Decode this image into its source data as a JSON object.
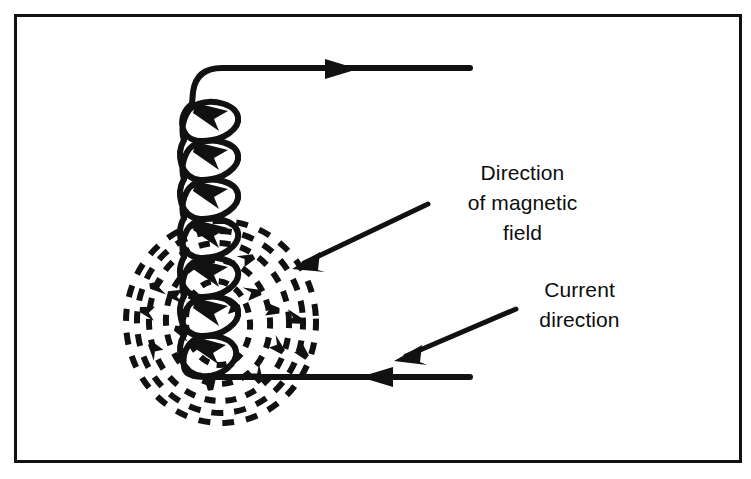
{
  "figure": {
    "background_color": "#ffffff",
    "ink_color": "#111111",
    "border": {
      "name": "figure-border",
      "x": 14,
      "y": 14,
      "width": 727,
      "height": 448,
      "stroke_width": 3
    }
  },
  "labels": {
    "magnetic_field": {
      "line1": "Direction",
      "line2": "of magnetic",
      "line3": "field",
      "full_text": "Direction of magnetic field"
    },
    "current": {
      "line1": "Current",
      "line2": "direction",
      "full_text": "Current direction"
    }
  },
  "annotations": {
    "magnetic_field_pointer": {
      "name": "magnetic-field-pointer-arrow",
      "from_x": 428,
      "from_y": 204,
      "to_x": 294,
      "to_y": 268,
      "direction": "down-left"
    },
    "current_pointer": {
      "name": "current-pointer-arrow",
      "from_x": 516,
      "from_y": 309,
      "to_x": 396,
      "to_y": 360,
      "direction": "down-left"
    }
  },
  "circuit": {
    "top_lead": {
      "name": "top-wire-lead",
      "start_x": 196,
      "start_y": 68,
      "end_x": 470,
      "end_y": 68,
      "arrow_x": 345,
      "arrow_direction": "right",
      "meaning": "current flowing out to the right"
    },
    "bottom_lead": {
      "name": "bottom-wire-lead",
      "start_x": 206,
      "start_y": 377,
      "end_x": 470,
      "end_y": 377,
      "arrow_x": 375,
      "arrow_direction": "left",
      "meaning": "current flowing in from the right"
    },
    "coil": {
      "name": "solenoid-coil",
      "loop_count": 7,
      "axis_x": 196,
      "top_y": 100,
      "bottom_y": 375,
      "loop_width": 50,
      "loop_height": 38,
      "loop_centers_y": [
        118,
        158,
        198,
        238,
        278,
        318,
        356
      ]
    }
  },
  "magnetic_field": {
    "name": "magnetic-field-lines",
    "style": "dashed concentric ellipses",
    "center_x": 218,
    "center_y": 323,
    "ring_count": 5,
    "rings": [
      {
        "rx": 32,
        "ry": 42
      },
      {
        "rx": 52,
        "ry": 62
      },
      {
        "rx": 70,
        "ry": 80
      },
      {
        "rx": 84,
        "ry": 92
      },
      {
        "rx": 96,
        "ry": 102
      }
    ],
    "dash_pattern": "9 7",
    "arrow_marks": 14
  }
}
